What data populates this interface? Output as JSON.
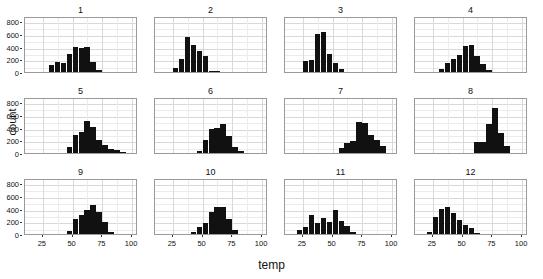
{
  "chart_data": {
    "type": "bar",
    "title": "",
    "subtitle": "",
    "xlabel": "temp",
    "ylabel": "count",
    "xlim": [
      10,
      105
    ],
    "ylim": [
      0,
      880
    ],
    "xticks": [
      25,
      50,
      75,
      100
    ],
    "yticks": [
      0,
      200,
      400,
      600,
      800
    ],
    "grid": true,
    "legend": "none",
    "facet_layout": {
      "rows": 3,
      "cols": 4,
      "facet_variable": "month"
    },
    "bin_width": 5,
    "panels": [
      {
        "title": "1",
        "bin_centers": [
          32.5,
          37.5,
          42.5,
          47.5,
          52.5,
          57.5,
          62.5,
          67.5,
          72.5
        ],
        "values": [
          110,
          155,
          145,
          290,
          400,
          385,
          390,
          150,
          25
        ]
      },
      {
        "title": "2",
        "bin_centers": [
          27.5,
          32.5,
          37.5,
          42.5,
          47.5,
          52.5,
          57.5,
          62.5
        ],
        "values": [
          60,
          205,
          550,
          420,
          330,
          250,
          15,
          5
        ]
      },
      {
        "title": "3",
        "bin_centers": [
          27.5,
          32.5,
          37.5,
          42.5,
          47.5,
          52.5,
          57.5
        ],
        "values": [
          180,
          195,
          600,
          630,
          290,
          140,
          40
        ]
      },
      {
        "title": "4",
        "bin_centers": [
          32.5,
          37.5,
          42.5,
          47.5,
          52.5,
          57.5,
          62.5,
          67.5,
          72.5
        ],
        "values": [
          40,
          140,
          210,
          260,
          410,
          430,
          250,
          120,
          30
        ]
      },
      {
        "title": "5",
        "bin_centers": [
          47.5,
          52.5,
          57.5,
          62.5,
          67.5,
          72.5,
          77.5,
          82.5,
          87.5,
          92.5
        ],
        "values": [
          100,
          290,
          330,
          510,
          410,
          200,
          130,
          60,
          50,
          15
        ]
      },
      {
        "title": "6",
        "bin_centers": [
          47.5,
          52.5,
          57.5,
          62.5,
          67.5,
          72.5,
          77.5,
          82.5
        ],
        "values": [
          25,
          210,
          370,
          390,
          450,
          270,
          90,
          25
        ]
      },
      {
        "title": "7",
        "bin_centers": [
          57.5,
          62.5,
          67.5,
          72.5,
          77.5,
          82.5,
          87.5,
          92.5
        ],
        "values": [
          80,
          150,
          185,
          480,
          470,
          290,
          200,
          110
        ]
      },
      {
        "title": "8",
        "bin_centers": [
          62.5,
          67.5,
          72.5,
          77.5,
          82.5,
          87.5
        ],
        "values": [
          170,
          175,
          450,
          700,
          310,
          110
        ]
      },
      {
        "title": "9",
        "bin_centers": [
          47.5,
          52.5,
          57.5,
          62.5,
          67.5,
          72.5,
          77.5,
          82.5
        ],
        "values": [
          55,
          230,
          300,
          380,
          460,
          350,
          190,
          30
        ]
      },
      {
        "title": "10",
        "bin_centers": [
          42.5,
          47.5,
          52.5,
          57.5,
          62.5,
          67.5,
          72.5,
          77.5
        ],
        "values": [
          30,
          110,
          180,
          340,
          420,
          430,
          240,
          60
        ]
      },
      {
        "title": "11",
        "bin_centers": [
          22.5,
          27.5,
          32.5,
          37.5,
          42.5,
          47.5,
          52.5,
          57.5,
          62.5,
          67.5
        ],
        "values": [
          60,
          110,
          300,
          175,
          250,
          195,
          370,
          200,
          130,
          35
        ]
      },
      {
        "title": "12",
        "bin_centers": [
          22.5,
          27.5,
          32.5,
          37.5,
          42.5,
          47.5,
          52.5,
          57.5,
          62.5
        ],
        "values": [
          25,
          270,
          390,
          420,
          330,
          215,
          135,
          90,
          20
        ]
      }
    ]
  }
}
